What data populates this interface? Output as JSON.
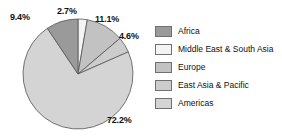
{
  "chart_data": {
    "type": "pie",
    "title": "",
    "labels": [
      "Africa",
      "Middle East & South Asia",
      "Europe",
      "East Asia & Pacific",
      "Americas"
    ],
    "values": [
      9.4,
      2.7,
      11.1,
      4.6,
      72.2
    ],
    "value_labels": [
      "9.4%",
      "2.7%",
      "11.1%",
      "4.6%",
      "72.2%"
    ],
    "unit": "%",
    "colors": [
      "#9a9a9a",
      "#f4f4f4",
      "#c2c2c2",
      "#cccccc",
      "#d4d4d4"
    ],
    "slice_order_clockwise_from_top": [
      "Middle East & South Asia",
      "Europe",
      "East Asia & Pacific",
      "Americas",
      "Africa"
    ],
    "legend_position": "right",
    "grid": false,
    "stroke_color": "#555555"
  },
  "pie": {
    "labels": {
      "africa": "9.4%",
      "middle_east_south_asia": "2.7%",
      "europe": "11.1%",
      "east_asia_pacific": "4.6%",
      "americas": "72.2%"
    }
  },
  "legend": {
    "items": [
      {
        "label": "Africa",
        "color": "#9a9a9a"
      },
      {
        "label": "Middle East & South Asia",
        "color": "#f4f4f4"
      },
      {
        "label": "Europe",
        "color": "#c2c2c2"
      },
      {
        "label": "East Asia & Pacific",
        "color": "#cccccc"
      },
      {
        "label": "Americas",
        "color": "#d4d4d4"
      }
    ]
  }
}
